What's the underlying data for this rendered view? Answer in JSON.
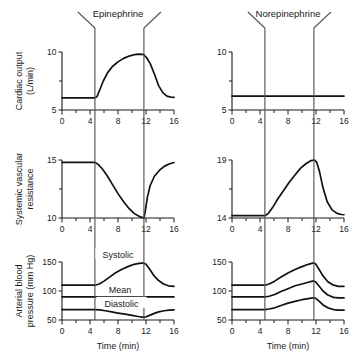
{
  "figure": {
    "background": "#ffffff",
    "curve_color": "#111111",
    "axis_color": "#1a1a1a",
    "marker_color": "#555555"
  },
  "columns": [
    {
      "id": "epinephrine",
      "title": "Epinephrine",
      "infusion_start": 4.7,
      "infusion_end": 11.7
    },
    {
      "id": "norepinephrine",
      "title": "Norepinephrine",
      "infusion_start": 4.7,
      "infusion_end": 11.7
    }
  ],
  "rows": [
    {
      "id": "cardiac-output",
      "label_line1": "Cardiac output",
      "label_line2": "(L/min)"
    },
    {
      "id": "systemic-vascular-resistance",
      "label_line1": "Systemic vascular",
      "label_line2": "resistance"
    },
    {
      "id": "arterial-blood-pressure",
      "label_line1": "Arterial blood",
      "label_line2": "pressure (mm Hg)"
    }
  ],
  "xaxis": {
    "title": "Time (min)",
    "ticks": [
      "0",
      "4",
      "8",
      "12",
      "16"
    ],
    "tick_values": [
      0,
      4,
      8,
      12,
      16
    ],
    "minor_step": 2,
    "range": [
      0,
      16
    ]
  },
  "curve_labels": {
    "systolic": "Systolic",
    "mean": "Mean",
    "diastolic": "Diastolic"
  },
  "chart_data": [
    {
      "type": "line",
      "id": "cardiac-output-epinephrine",
      "title": "Epinephrine",
      "xlabel": "Time (min)",
      "ylabel": "Cardiac output (L/min)",
      "xlim": [
        0,
        16
      ],
      "ylim": [
        5,
        10
      ],
      "yticks": [
        5,
        10
      ],
      "ytick_labels": [
        "5",
        "10"
      ],
      "grid": false,
      "annotations": [
        {
          "label": "infusion start",
          "x": 4.7
        },
        {
          "label": "infusion end",
          "x": 11.7
        }
      ],
      "series": [
        {
          "name": "Cardiac output",
          "x": [
            0,
            1,
            2,
            3,
            4,
            4.7,
            5.0,
            5.4,
            5.9,
            6.5,
            7.2,
            8.0,
            8.8,
            9.6,
            10.4,
            11.0,
            11.5,
            11.7,
            12.1,
            12.6,
            13.2,
            13.8,
            14.4,
            15.0,
            15.6,
            16
          ],
          "y": [
            6.05,
            6.05,
            6.05,
            6.05,
            6.05,
            6.05,
            6.15,
            6.75,
            7.5,
            8.2,
            8.75,
            9.15,
            9.45,
            9.65,
            9.78,
            9.82,
            9.8,
            9.75,
            9.5,
            9.0,
            8.1,
            7.1,
            6.5,
            6.2,
            6.1,
            6.08
          ]
        }
      ]
    },
    {
      "type": "line",
      "id": "cardiac-output-norepinephrine",
      "title": "Norepinephrine",
      "xlabel": "Time (min)",
      "ylabel": "Cardiac output (L/min)",
      "xlim": [
        0,
        16
      ],
      "ylim": [
        5,
        10
      ],
      "yticks": [
        5,
        10
      ],
      "ytick_labels": [
        "5",
        "10"
      ],
      "grid": false,
      "annotations": [
        {
          "label": "infusion start",
          "x": 4.7
        },
        {
          "label": "infusion end",
          "x": 11.7
        }
      ],
      "series": [
        {
          "name": "Cardiac output",
          "x": [
            0,
            4,
            8,
            12,
            16
          ],
          "y": [
            6.2,
            6.2,
            6.2,
            6.2,
            6.2
          ]
        }
      ]
    },
    {
      "type": "line",
      "id": "svr-epinephrine",
      "title": "Epinephrine",
      "xlabel": "Time (min)",
      "ylabel": "Systemic vascular resistance",
      "xlim": [
        0,
        16
      ],
      "ylim": [
        10,
        15
      ],
      "yticks": [
        10,
        15
      ],
      "ytick_labels": [
        "10",
        "15"
      ],
      "grid": false,
      "annotations": [
        {
          "label": "infusion start",
          "x": 4.7
        },
        {
          "label": "infusion end",
          "x": 11.7
        }
      ],
      "series": [
        {
          "name": "Systemic vascular resistance",
          "x": [
            0,
            2,
            4,
            4.7,
            5.2,
            5.8,
            6.5,
            7.2,
            8.0,
            8.8,
            9.6,
            10.3,
            11.0,
            11.5,
            11.7,
            11.9,
            12.2,
            12.6,
            13.2,
            13.9,
            14.6,
            15.3,
            16
          ],
          "y": [
            14.8,
            14.8,
            14.8,
            14.8,
            14.6,
            14.2,
            13.6,
            12.9,
            12.1,
            11.4,
            10.8,
            10.4,
            10.15,
            10.03,
            10.0,
            10.6,
            11.8,
            12.8,
            13.6,
            14.1,
            14.45,
            14.65,
            14.78
          ]
        }
      ]
    },
    {
      "type": "line",
      "id": "svr-norepinephrine",
      "title": "Norepinephrine",
      "xlabel": "Time (min)",
      "ylabel": "Systemic vascular resistance",
      "xlim": [
        0,
        16
      ],
      "ylim": [
        14,
        19
      ],
      "yticks": [
        14,
        19
      ],
      "ytick_labels": [
        "14",
        "19"
      ],
      "grid": false,
      "annotations": [
        {
          "label": "infusion start",
          "x": 4.7
        },
        {
          "label": "infusion end",
          "x": 11.7
        }
      ],
      "series": [
        {
          "name": "Systemic vascular resistance",
          "x": [
            0,
            2,
            4,
            4.7,
            5.2,
            5.9,
            6.6,
            7.4,
            8.2,
            9.0,
            9.8,
            10.6,
            11.3,
            11.8,
            12.1,
            12.5,
            13.0,
            13.6,
            14.3,
            15.0,
            15.6,
            16
          ],
          "y": [
            14.2,
            14.2,
            14.2,
            14.2,
            14.4,
            15.0,
            15.7,
            16.4,
            17.1,
            17.7,
            18.3,
            18.7,
            18.95,
            19.0,
            18.8,
            18.0,
            16.6,
            15.4,
            14.7,
            14.4,
            14.3,
            14.28
          ]
        }
      ]
    },
    {
      "type": "line",
      "id": "abp-epinephrine",
      "title": "Epinephrine",
      "xlabel": "Time (min)",
      "ylabel": "Arterial blood pressure (mm Hg)",
      "xlim": [
        0,
        16
      ],
      "ylim": [
        50,
        150
      ],
      "yticks": [
        50,
        100,
        150
      ],
      "ytick_labels": [
        "50",
        "100",
        "150"
      ],
      "grid": false,
      "annotations": [
        {
          "label": "infusion start",
          "x": 4.7
        },
        {
          "label": "infusion end",
          "x": 11.7
        }
      ],
      "series": [
        {
          "name": "Systolic",
          "x": [
            0,
            2,
            4,
            4.7,
            5.3,
            6.0,
            6.8,
            7.6,
            8.5,
            9.4,
            10.3,
            11.0,
            11.5,
            11.7,
            12.0,
            12.5,
            13.1,
            13.8,
            14.5,
            15.2,
            16
          ],
          "y": [
            110,
            110,
            110,
            110,
            112,
            117,
            124,
            131,
            137,
            142,
            146,
            147.5,
            148,
            148,
            146,
            138,
            127,
            118,
            112,
            109,
            108
          ]
        },
        {
          "name": "Mean",
          "x": [
            0,
            4,
            8,
            12,
            16
          ],
          "y": [
            90,
            90,
            90,
            90,
            90
          ]
        },
        {
          "name": "Diastolic",
          "x": [
            0,
            2,
            4,
            4.7,
            5.4,
            6.2,
            7.1,
            8.0,
            9.0,
            10.0,
            10.9,
            11.5,
            11.7,
            12.0,
            12.5,
            13.1,
            13.8,
            14.6,
            15.3,
            16
          ],
          "y": [
            68,
            68,
            68,
            68,
            67.5,
            66,
            64,
            62,
            60,
            58,
            56,
            55,
            55,
            55.5,
            58,
            61,
            64,
            66,
            67,
            67.5
          ]
        }
      ]
    },
    {
      "type": "line",
      "id": "abp-norepinephrine",
      "title": "Norepinephrine",
      "xlabel": "Time (min)",
      "ylabel": "Arterial blood pressure (mm Hg)",
      "xlim": [
        0,
        150
      ],
      "ylim": [
        50,
        150
      ],
      "yticks": [
        50,
        100,
        150
      ],
      "ytick_labels": [
        "50",
        "100",
        "150"
      ],
      "grid": false,
      "annotations": [
        {
          "label": "infusion start",
          "x": 4.7
        },
        {
          "label": "infusion end",
          "x": 11.7
        }
      ],
      "series": [
        {
          "name": "Systolic",
          "x": [
            0,
            2,
            4,
            4.7,
            5.3,
            6.1,
            7.0,
            8.0,
            9.0,
            10.0,
            10.9,
            11.5,
            11.7,
            12.0,
            12.4,
            13.0,
            13.7,
            14.5,
            15.2,
            16
          ],
          "y": [
            110,
            110,
            110,
            110,
            112,
            117,
            124,
            131,
            137,
            142,
            146,
            148,
            148.5,
            146,
            138,
            126,
            116,
            110,
            108,
            108
          ]
        },
        {
          "name": "Mean",
          "x": [
            0,
            2,
            4,
            4.7,
            5.3,
            6.1,
            7.0,
            8.0,
            9.0,
            10.0,
            10.9,
            11.5,
            11.7,
            12.0,
            12.4,
            13.0,
            13.7,
            14.5,
            15.2,
            16
          ],
          "y": [
            90,
            90,
            90,
            90,
            91,
            94,
            99,
            104,
            109,
            112,
            115,
            117,
            117.5,
            115,
            109,
            100,
            93,
            89,
            88,
            88
          ]
        },
        {
          "name": "Diastolic",
          "x": [
            0,
            2,
            4,
            4.7,
            5.3,
            6.1,
            7.0,
            8.0,
            9.0,
            10.0,
            10.9,
            11.5,
            11.7,
            12.0,
            12.4,
            13.0,
            13.7,
            14.5,
            15.2,
            16
          ],
          "y": [
            68,
            68,
            68,
            68,
            69,
            71,
            75,
            79,
            82,
            85,
            87,
            88,
            88.5,
            87,
            83,
            76,
            71,
            68,
            67,
            67
          ]
        }
      ]
    }
  ]
}
